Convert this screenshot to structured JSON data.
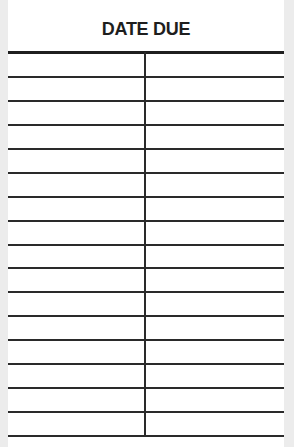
{
  "card": {
    "title": "DATE DUE",
    "columns": 2,
    "rows": [
      {
        "left": "",
        "right": ""
      },
      {
        "left": "",
        "right": ""
      },
      {
        "left": "",
        "right": ""
      },
      {
        "left": "",
        "right": ""
      },
      {
        "left": "",
        "right": ""
      },
      {
        "left": "",
        "right": ""
      },
      {
        "left": "",
        "right": ""
      },
      {
        "left": "",
        "right": ""
      },
      {
        "left": "",
        "right": ""
      },
      {
        "left": "",
        "right": ""
      },
      {
        "left": "",
        "right": ""
      },
      {
        "left": "",
        "right": ""
      },
      {
        "left": "",
        "right": ""
      },
      {
        "left": "",
        "right": ""
      },
      {
        "left": "",
        "right": ""
      },
      {
        "left": "",
        "right": ""
      }
    ]
  },
  "colors": {
    "paper": "#ffffff",
    "ink": "#1e1e1e",
    "edge": "#ececec"
  }
}
